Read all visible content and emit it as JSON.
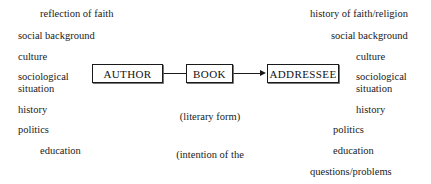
{
  "diagram": {
    "type": "flow-diagram",
    "background_color": "#ffffff",
    "text_color": "#1a1a1a",
    "left_column": {
      "label": "author-side context factors",
      "items": [
        {
          "text": "reflection of faith",
          "x": 40,
          "y": 8
        },
        {
          "text": "social background",
          "x": 18,
          "y": 30
        },
        {
          "text": "culture",
          "x": 18,
          "y": 51
        },
        {
          "text": "sociological",
          "x": 18,
          "y": 71
        },
        {
          "text": "situation",
          "x": 18,
          "y": 83
        },
        {
          "text": "history",
          "x": 18,
          "y": 104
        },
        {
          "text": "politics",
          "x": 18,
          "y": 124
        },
        {
          "text": "education",
          "x": 40,
          "y": 145
        }
      ]
    },
    "right_column": {
      "label": "addressee-side context factors",
      "items": [
        {
          "text": "history of faith/religion",
          "x": 310,
          "y": 8
        },
        {
          "text": "social background",
          "x": 331,
          "y": 30
        },
        {
          "text": "culture",
          "x": 356,
          "y": 51
        },
        {
          "text": "sociological",
          "x": 356,
          "y": 71
        },
        {
          "text": "situation",
          "x": 356,
          "y": 83
        },
        {
          "text": "history",
          "x": 356,
          "y": 104
        },
        {
          "text": "politics",
          "x": 333,
          "y": 124
        },
        {
          "text": "education",
          "x": 333,
          "y": 145
        },
        {
          "text": "questions/problems",
          "x": 310,
          "y": 166
        }
      ]
    },
    "nodes": [
      {
        "id": "author",
        "label": "AUTHOR",
        "x": 92,
        "y": 64,
        "w": 71,
        "h": 19
      },
      {
        "id": "book",
        "label": "BOOK",
        "x": 186,
        "y": 64,
        "w": 47,
        "h": 19
      },
      {
        "id": "addressee",
        "label": "ADDRESSEE",
        "x": 267,
        "y": 64,
        "w": 72,
        "h": 19
      }
    ],
    "edges": [
      {
        "from": "author",
        "to": "book",
        "arrow": false
      },
      {
        "from": "book",
        "to": "addressee",
        "arrow": true
      }
    ],
    "caption": {
      "lines": [
        "(literary form)",
        "(intention of the",
        "author)"
      ]
    }
  }
}
